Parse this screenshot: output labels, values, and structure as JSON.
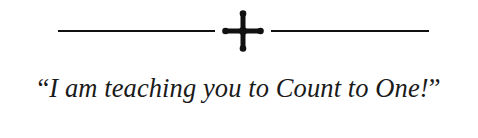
{
  "ornament": {
    "icon": "botonnee-cross-icon",
    "color": "#111111"
  },
  "quote": {
    "open_mark": "“",
    "text": "I am teaching you to Count to One!",
    "close_mark": "”"
  }
}
